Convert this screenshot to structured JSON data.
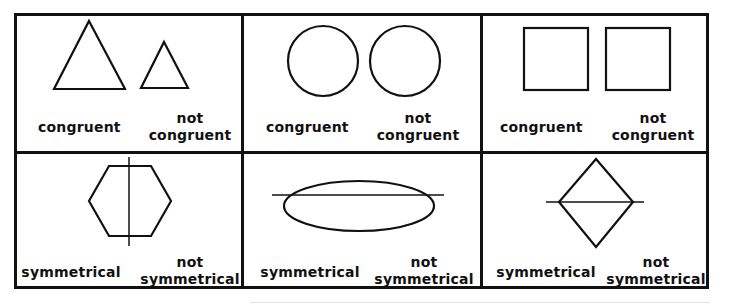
{
  "diagram": {
    "rows": [
      {
        "concept": "congruence",
        "cells": [
          {
            "shape": "triangle",
            "labels": {
              "positive": "congruent",
              "negative_line1": "not",
              "negative_line2": "congruent"
            }
          },
          {
            "shape": "circle",
            "labels": {
              "positive": "congruent",
              "negative_line1": "not",
              "negative_line2": "congruent"
            }
          },
          {
            "shape": "square",
            "labels": {
              "positive": "congruent",
              "negative_line1": "not",
              "negative_line2": "congruent"
            }
          }
        ]
      },
      {
        "concept": "symmetry",
        "cells": [
          {
            "shape": "hexagon",
            "axis": "vertical",
            "labels": {
              "positive": "symmetrical",
              "negative_line1": "not",
              "negative_line2": "symmetrical"
            }
          },
          {
            "shape": "ellipse",
            "axis": "horizontal",
            "labels": {
              "positive": "symmetrical",
              "negative_line1": "not",
              "negative_line2": "symmetrical"
            }
          },
          {
            "shape": "rhombus",
            "axis": "horizontal",
            "labels": {
              "positive": "symmetrical",
              "negative_line1": "not",
              "negative_line2": "symmetrical"
            }
          }
        ]
      }
    ],
    "colors": {
      "stroke": "#111111",
      "background": "#ffffff"
    }
  }
}
